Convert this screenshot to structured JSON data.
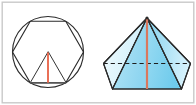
{
  "figure": {
    "width": 196,
    "height": 105,
    "background_color": "#ffffff",
    "border_color": "#c9c9c9"
  },
  "colors": {
    "outline": "#2b2b2b",
    "hidden_edge": "#1d1d1d",
    "height_axis_2d": "#e8694f",
    "height_axis_3d": "#d9785f",
    "face_light": "#d9f2fb",
    "face_mid": "#9fdcf2",
    "face_dark": "#7fd0ee",
    "base_face": "#bfe9f8",
    "background": "#ffffff"
  },
  "panels": [
    {
      "id": "left-panel",
      "name": "circle-with-inscribed-hexagon",
      "label": "Circle with inscribed regular hexagon and central triangle",
      "shapes": [
        {
          "name": "circumscribed-circle",
          "type": "circle",
          "cx": 48,
          "cy": 52,
          "r": 36
        },
        {
          "name": "inscribed-hexagon",
          "type": "polygon",
          "sides": 6,
          "cx": 48,
          "cy": 52,
          "r": 36,
          "rotation_deg": 0
        },
        {
          "name": "central-triangle",
          "type": "triangle",
          "apex": [
            48,
            52
          ],
          "base_left": [
            30,
            83
          ],
          "base_right": [
            66,
            83
          ]
        },
        {
          "name": "apothem-height-line",
          "type": "segment",
          "from": [
            48,
            52
          ],
          "to": [
            48,
            83
          ],
          "color": "#e8694f"
        }
      ]
    },
    {
      "id": "right-panel",
      "name": "hexagonal-pyramid",
      "label": "Hexagonal pyramid with vertical height axis",
      "shapes": [
        {
          "name": "pyramid-apex",
          "type": "point",
          "x": 147,
          "y": 18
        },
        {
          "name": "pyramid-base-hexagon",
          "type": "polygon",
          "sides": 6,
          "cx": 147,
          "cy": 72,
          "rx": 44,
          "ry": 17
        },
        {
          "name": "pyramid-height-axis",
          "type": "segment",
          "from": [
            147,
            18
          ],
          "to": [
            147,
            89
          ],
          "color": "#d9785f"
        },
        {
          "name": "hidden-back-diagonal",
          "type": "segment_dashed",
          "from": [
            110,
            63
          ],
          "to": [
            184,
            63
          ]
        },
        {
          "name": "hidden-back-edge-left",
          "type": "segment_dashed",
          "from": [
            110,
            63
          ],
          "to": [
            147,
            18
          ]
        },
        {
          "name": "hidden-back-edge-right",
          "type": "segment_dashed",
          "from": [
            184,
            63
          ],
          "to": [
            147,
            18
          ]
        },
        {
          "name": "hidden-apex-to-center",
          "type": "segment_dashed",
          "from": [
            147,
            18
          ],
          "to": [
            147,
            63
          ]
        }
      ],
      "faces": [
        {
          "name": "face-front-left",
          "shade": "#8fd6f0"
        },
        {
          "name": "face-front-center",
          "shade": "#a8e0f4"
        },
        {
          "name": "face-front-right",
          "shade": "#7fd0ee"
        },
        {
          "name": "face-side-left",
          "shade": "#d9f2fb"
        },
        {
          "name": "face-side-right",
          "shade": "#b9e6f7"
        }
      ]
    }
  ]
}
